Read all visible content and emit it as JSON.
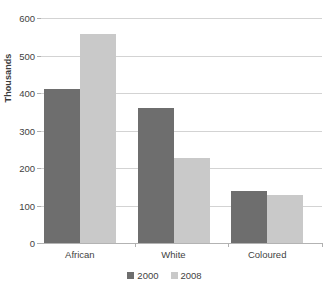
{
  "chart_data": {
    "type": "bar",
    "title": "",
    "subtitle": "",
    "xlabel": "",
    "ylabel": "Thousands",
    "categories": [
      "African",
      "White",
      "Coloured"
    ],
    "series": [
      {
        "name": "2000",
        "color": "#6e6e6e",
        "values": [
          412,
          360,
          140
        ]
      },
      {
        "name": "2008",
        "color": "#c9c9c9",
        "values": [
          557,
          226,
          129
        ]
      }
    ],
    "ylim": [
      0,
      600
    ],
    "ytick_step": 100,
    "ytick_labels": [
      "0",
      "100",
      "200",
      "300",
      "400",
      "500",
      "600"
    ],
    "grid": "horizontal",
    "legend_position": "bottom-center",
    "plot_background": "#ffffff",
    "gridline_color": "#d3d3d3"
  }
}
